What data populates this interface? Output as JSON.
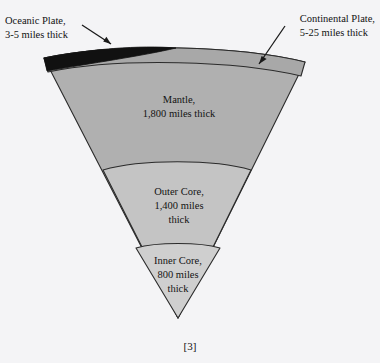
{
  "figure": {
    "citation": "[3]",
    "background_color": "#f4f4f6"
  },
  "callouts": [
    {
      "name": "oceanic-plate",
      "line1": "Oceanic Plate,",
      "line2": "3-5 miles thick",
      "points_to": "oceanic-plate-lens"
    },
    {
      "name": "continental-plate",
      "line1": "Continental Plate,",
      "line2": "5-25 miles thick",
      "points_to": "crust-band"
    }
  ],
  "layers": [
    {
      "name": "oceanic-plate-lens",
      "label": "",
      "color": "#111111"
    },
    {
      "name": "crust",
      "label": "",
      "color": "#a8a8a8"
    },
    {
      "name": "mantle",
      "line1": "Mantle,",
      "line2": "1,800 miles thick",
      "color": "#b0b0b0"
    },
    {
      "name": "outer-core",
      "line1": "Outer Core,",
      "line2": "1,400 miles",
      "line3": "thick",
      "color": "#c4c4c4"
    },
    {
      "name": "inner-core",
      "line1": "Inner Core,",
      "line2": "800 miles",
      "line3": "thick",
      "color": "#cfcfcf"
    }
  ],
  "colors": {
    "outline": "#2b2b2b",
    "oceanic_plate": "#111111",
    "crust": "#a8a8a8",
    "mantle": "#b0b0b0",
    "outer_core": "#c4c4c4",
    "inner_core": "#cfcfcf",
    "arrow": "#1a1a1a",
    "text": "#121212"
  }
}
